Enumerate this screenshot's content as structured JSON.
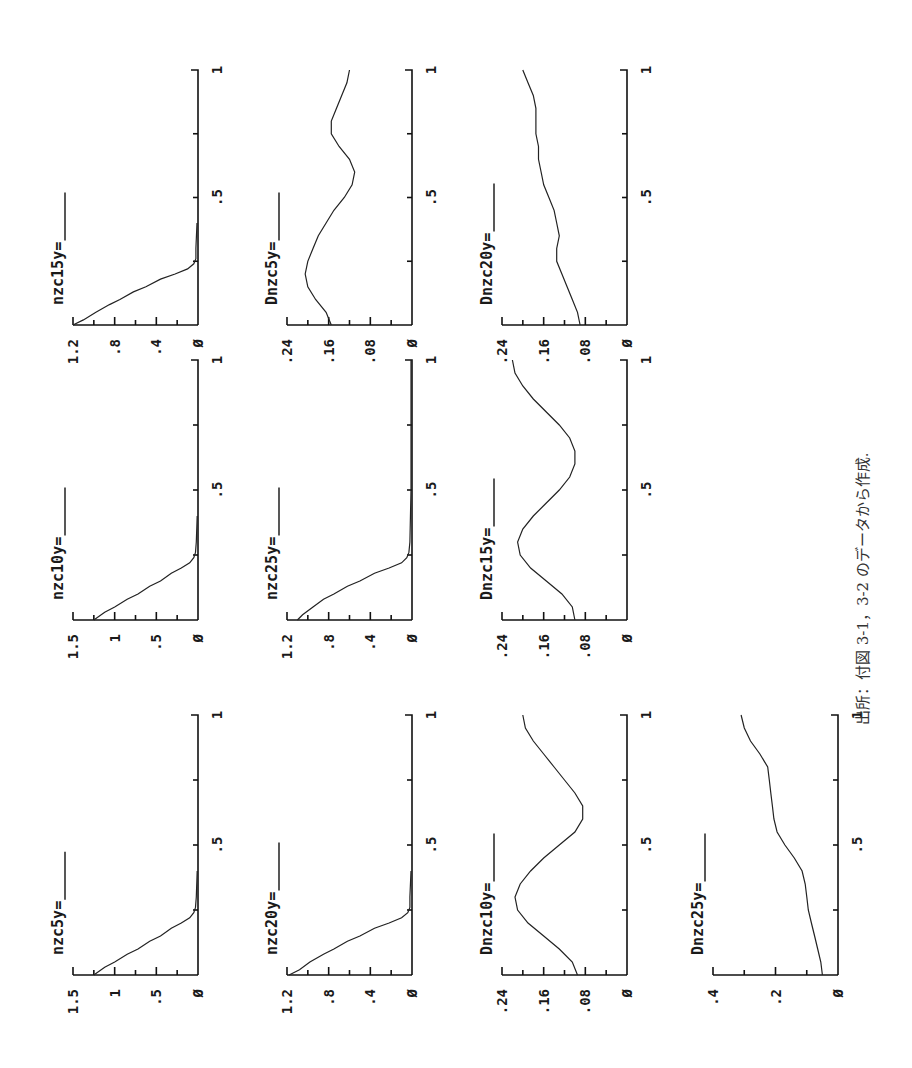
{
  "page": {
    "rotation_deg": -90,
    "source_note": "出所：付図 3-1，3-2 のデータから作成."
  },
  "layout": {
    "stack_baselines_x": [
      198,
      412,
      627,
      838
    ],
    "value_axis_length": 125,
    "bands": [
      {
        "y_at_0": 325,
        "y_at_1": 70
      },
      {
        "y_at_0": 620,
        "y_at_1": 360
      },
      {
        "y_at_0": 975,
        "y_at_1": 715
      }
    ]
  },
  "chart_data": [
    {
      "type": "line",
      "title": "nzc5y=",
      "band": 2,
      "stack": 0,
      "xlabel": "",
      "ylabel": "",
      "xticks": [
        "",
        ".5",
        "1"
      ],
      "xlim": [
        0,
        1
      ],
      "ylim": [
        0,
        1.5
      ],
      "yticks": [
        "1.5",
        "1",
        ".5",
        "Ø"
      ],
      "yticks_vals": [
        1.5,
        1,
        0.5,
        0
      ],
      "minor_y": [
        1.25,
        0.75,
        0.25
      ],
      "x": [
        0,
        0.03,
        0.05,
        0.08,
        0.1,
        0.13,
        0.15,
        0.18,
        0.2,
        0.22,
        0.24,
        0.26,
        0.3,
        0.4
      ],
      "y": [
        1.25,
        1.12,
        1.0,
        0.85,
        0.72,
        0.58,
        0.45,
        0.32,
        0.2,
        0.1,
        0.05,
        0.03,
        0.02,
        0.01
      ]
    },
    {
      "type": "line",
      "title": "nzc10y=",
      "band": 1,
      "stack": 0,
      "xticks": [
        "",
        ".5",
        "1"
      ],
      "xlim": [
        0,
        1
      ],
      "ylim": [
        0,
        1.5
      ],
      "yticks": [
        "1.5",
        "1",
        ".5",
        "Ø"
      ],
      "yticks_vals": [
        1.5,
        1,
        0.5,
        0
      ],
      "minor_y": [
        1.25,
        0.75,
        0.25
      ],
      "x": [
        0,
        0.03,
        0.05,
        0.08,
        0.1,
        0.13,
        0.15,
        0.18,
        0.2,
        0.22,
        0.24,
        0.26,
        0.3,
        0.4
      ],
      "y": [
        1.25,
        1.12,
        1.0,
        0.85,
        0.72,
        0.58,
        0.45,
        0.32,
        0.2,
        0.1,
        0.05,
        0.03,
        0.02,
        0.01
      ]
    },
    {
      "type": "line",
      "title": "nzc15y=",
      "band": 0,
      "stack": 0,
      "xticks": [
        "",
        ".5",
        "1"
      ],
      "xlim": [
        0,
        1
      ],
      "ylim": [
        0,
        1.2
      ],
      "yticks": [
        "1.2",
        ".8",
        ".4",
        "Ø"
      ],
      "yticks_vals": [
        1.2,
        0.8,
        0.4,
        0
      ],
      "minor_y": [
        1.0,
        0.6,
        0.2
      ],
      "x": [
        0,
        0.02,
        0.05,
        0.08,
        0.1,
        0.13,
        0.15,
        0.18,
        0.2,
        0.22,
        0.24,
        0.26,
        0.3,
        0.4
      ],
      "y": [
        1.2,
        1.1,
        0.98,
        0.85,
        0.75,
        0.62,
        0.5,
        0.36,
        0.22,
        0.1,
        0.04,
        0.02,
        0.02,
        0.01
      ]
    },
    {
      "type": "line",
      "title": "nzc20y=",
      "band": 2,
      "stack": 1,
      "xticks": [
        "",
        ".5",
        "1"
      ],
      "xlim": [
        0,
        1
      ],
      "ylim": [
        0,
        1.2
      ],
      "yticks": [
        "1.2",
        ".8",
        ".4",
        "Ø"
      ],
      "yticks_vals": [
        1.2,
        0.8,
        0.4,
        0
      ],
      "minor_y": [
        1.0,
        0.6,
        0.2
      ],
      "x": [
        0,
        0.02,
        0.05,
        0.08,
        0.1,
        0.13,
        0.15,
        0.18,
        0.2,
        0.22,
        0.24,
        0.26,
        0.3,
        0.4
      ],
      "y": [
        1.18,
        1.08,
        0.98,
        0.85,
        0.75,
        0.62,
        0.5,
        0.36,
        0.22,
        0.1,
        0.04,
        0.02,
        0.02,
        0.01
      ]
    },
    {
      "type": "line",
      "title": "nzc25y=",
      "band": 1,
      "stack": 1,
      "xticks": [
        "",
        ".5",
        "1"
      ],
      "xlim": [
        0,
        1
      ],
      "ylim": [
        0,
        1.2
      ],
      "yticks": [
        "1.2",
        ".8",
        ".4",
        "Ø"
      ],
      "yticks_vals": [
        1.2,
        0.8,
        0.4,
        0
      ],
      "minor_y": [
        1.0,
        0.6,
        0.2
      ],
      "x": [
        0,
        0.02,
        0.05,
        0.08,
        0.1,
        0.13,
        0.15,
        0.18,
        0.2,
        0.22,
        0.24,
        0.26,
        0.3,
        0.5,
        1.0
      ],
      "y": [
        1.1,
        1.05,
        0.95,
        0.85,
        0.75,
        0.62,
        0.5,
        0.36,
        0.22,
        0.1,
        0.05,
        0.03,
        0.02,
        0.01,
        0.01
      ]
    },
    {
      "type": "line",
      "title": "Dnzc5y=",
      "band": 0,
      "stack": 1,
      "xticks": [
        "",
        ".5",
        "1"
      ],
      "xlim": [
        0,
        1
      ],
      "ylim": [
        0,
        0.24
      ],
      "yticks": [
        ".24",
        ".16",
        ".08",
        "Ø"
      ],
      "yticks_vals": [
        0.24,
        0.16,
        0.08,
        0
      ],
      "minor_y": [
        0.2,
        0.12,
        0.04
      ],
      "x": [
        0,
        0.05,
        0.1,
        0.15,
        0.2,
        0.25,
        0.3,
        0.35,
        0.4,
        0.45,
        0.5,
        0.55,
        0.6,
        0.65,
        0.7,
        0.75,
        0.8,
        0.85,
        0.9,
        0.95,
        1.0
      ],
      "y": [
        0.155,
        0.165,
        0.185,
        0.2,
        0.205,
        0.2,
        0.19,
        0.18,
        0.165,
        0.15,
        0.13,
        0.115,
        0.11,
        0.12,
        0.14,
        0.155,
        0.155,
        0.145,
        0.135,
        0.125,
        0.12
      ]
    },
    {
      "type": "line",
      "title": "Dnzc10y=",
      "band": 2,
      "stack": 2,
      "xticks": [
        "",
        ".5",
        "1"
      ],
      "xlim": [
        0,
        1
      ],
      "ylim": [
        0,
        0.24
      ],
      "yticks": [
        ".24",
        ".16",
        ".08",
        "Ø"
      ],
      "yticks_vals": [
        0.24,
        0.16,
        0.08,
        0
      ],
      "minor_y": [
        0.2,
        0.12,
        0.04
      ],
      "x": [
        0,
        0.05,
        0.1,
        0.15,
        0.2,
        0.25,
        0.3,
        0.35,
        0.4,
        0.45,
        0.5,
        0.55,
        0.6,
        0.65,
        0.7,
        0.75,
        0.8,
        0.85,
        0.9,
        0.95,
        1.0
      ],
      "y": [
        0.095,
        0.105,
        0.13,
        0.16,
        0.19,
        0.21,
        0.215,
        0.205,
        0.185,
        0.16,
        0.13,
        0.1,
        0.085,
        0.085,
        0.1,
        0.12,
        0.14,
        0.16,
        0.18,
        0.195,
        0.2
      ]
    },
    {
      "type": "line",
      "title": "Dnzc15y=",
      "band": 1,
      "stack": 2,
      "xticks": [
        "",
        ".5",
        "1"
      ],
      "xlim": [
        0,
        1
      ],
      "ylim": [
        0,
        0.24
      ],
      "yticks": [
        ".24",
        ".16",
        ".08",
        "Ø"
      ],
      "yticks_vals": [
        0.24,
        0.16,
        0.08,
        0
      ],
      "minor_y": [
        0.2,
        0.12,
        0.04
      ],
      "x": [
        0,
        0.05,
        0.1,
        0.15,
        0.2,
        0.25,
        0.3,
        0.35,
        0.4,
        0.45,
        0.5,
        0.55,
        0.6,
        0.65,
        0.7,
        0.75,
        0.8,
        0.85,
        0.9,
        0.95,
        1.0
      ],
      "y": [
        0.1,
        0.105,
        0.125,
        0.155,
        0.185,
        0.205,
        0.21,
        0.2,
        0.18,
        0.155,
        0.13,
        0.11,
        0.1,
        0.1,
        0.11,
        0.13,
        0.155,
        0.18,
        0.2,
        0.215,
        0.22
      ]
    },
    {
      "type": "line",
      "title": "Dnzc20y=",
      "band": 0,
      "stack": 2,
      "xticks": [
        "",
        ".5",
        "1"
      ],
      "xlim": [
        0,
        1
      ],
      "ylim": [
        0,
        0.24
      ],
      "yticks": [
        ".24",
        ".16",
        ".08",
        "Ø"
      ],
      "yticks_vals": [
        0.24,
        0.16,
        0.08,
        0
      ],
      "minor_y": [
        0.2,
        0.12,
        0.04
      ],
      "x": [
        0,
        0.05,
        0.1,
        0.15,
        0.2,
        0.25,
        0.3,
        0.35,
        0.4,
        0.45,
        0.5,
        0.55,
        0.6,
        0.65,
        0.7,
        0.75,
        0.8,
        0.85,
        0.9,
        0.95,
        1.0
      ],
      "y": [
        0.09,
        0.095,
        0.105,
        0.115,
        0.125,
        0.135,
        0.135,
        0.13,
        0.135,
        0.14,
        0.15,
        0.16,
        0.165,
        0.17,
        0.17,
        0.175,
        0.175,
        0.175,
        0.18,
        0.19,
        0.2
      ]
    },
    {
      "type": "line",
      "title": "Dnzc25y=",
      "band": 2,
      "stack": 3,
      "xticks": [
        "",
        ".5",
        "1"
      ],
      "xlim": [
        0,
        1
      ],
      "ylim": [
        0,
        0.4
      ],
      "yticks": [
        ".4",
        ".2",
        "Ø"
      ],
      "yticks_vals": [
        0.4,
        0.2,
        0
      ],
      "minor_y": [
        0.3,
        0.1
      ],
      "x": [
        0,
        0.05,
        0.1,
        0.15,
        0.2,
        0.25,
        0.3,
        0.35,
        0.4,
        0.45,
        0.5,
        0.55,
        0.6,
        0.65,
        0.7,
        0.75,
        0.8,
        0.85,
        0.9,
        0.95,
        1.0
      ],
      "y": [
        0.05,
        0.055,
        0.065,
        0.075,
        0.085,
        0.095,
        0.1,
        0.105,
        0.115,
        0.14,
        0.17,
        0.195,
        0.205,
        0.21,
        0.215,
        0.22,
        0.225,
        0.25,
        0.28,
        0.3,
        0.31
      ]
    }
  ]
}
